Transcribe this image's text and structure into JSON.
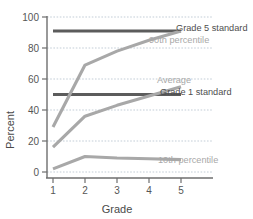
{
  "chart_data": {
    "type": "line",
    "title": "",
    "xlabel": "Grade",
    "ylabel": "Percent",
    "x": [
      1,
      2,
      3,
      4,
      5
    ],
    "xticklabels": [
      "1",
      "2",
      "3",
      "4",
      "5"
    ],
    "yticklabels": [
      "0",
      "20",
      "40",
      "60",
      "80",
      "100"
    ],
    "yticks": [
      0,
      20,
      40,
      60,
      80,
      100
    ],
    "xlim": [
      0.7,
      5.5
    ],
    "ylim": [
      0,
      100
    ],
    "grid": "horizontal-dashed",
    "legend_position": "inline-right-annotations",
    "series": [
      {
        "name": "90th percentile",
        "values": [
          29,
          69,
          78,
          85,
          91
        ],
        "color": "#a8a8a8",
        "kind": "data"
      },
      {
        "name": "Average",
        "values": [
          16,
          36,
          43,
          49,
          55
        ],
        "color": "#a8a8a8",
        "kind": "data"
      },
      {
        "name": "10th percentile",
        "values": [
          2,
          10,
          9,
          8.5,
          8
        ],
        "color": "#a8a8a8",
        "kind": "data"
      },
      {
        "name": "Grade 5 standard",
        "values": [
          91,
          91,
          91,
          91,
          91
        ],
        "color": "#5c5c5c",
        "kind": "reference"
      },
      {
        "name": "Grade 1 standard",
        "values": [
          50,
          50,
          50,
          50,
          50
        ],
        "color": "#5c5c5c",
        "kind": "reference"
      }
    ],
    "annotations": [
      {
        "text": "Grade 5 standard",
        "style": "dark",
        "x": 176,
        "y": 31
      },
      {
        "text": "90th percentile",
        "style": "light",
        "x": 149,
        "y": 43
      },
      {
        "text": "Average",
        "style": "light",
        "x": 157,
        "y": 83
      },
      {
        "text": "Grade 1 standard",
        "style": "dark",
        "x": 160,
        "y": 95
      },
      {
        "text": "10th percentile",
        "style": "light",
        "x": 158,
        "y": 163
      }
    ]
  }
}
